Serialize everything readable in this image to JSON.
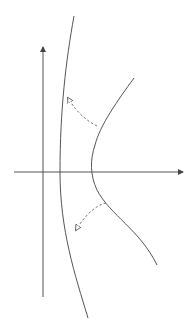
{
  "diagram": {
    "type": "phase-plane-sketch",
    "background": "#ffffff",
    "stroke_color": "#555555",
    "axes": {
      "x_axis": {
        "y": 172,
        "x_start": 14,
        "x_end": 183,
        "arrow": "right"
      },
      "y_axis": {
        "x": 43,
        "y_start": 297,
        "y_end": 47,
        "arrow": "up"
      }
    },
    "curves": [
      {
        "name": "left-curve",
        "style": "solid",
        "path": "M74,16 C66,60 60,110 60,172 C60,230 75,275 88,318"
      },
      {
        "name": "right-curve",
        "style": "solid",
        "path": "M134,78 C118,100 100,125 95,145 C90,160 90,175 97,190 C110,215 140,230 157,265"
      }
    ],
    "arrows": [
      {
        "name": "dashed-arrow-upper",
        "style": "dashed",
        "path": "M97,126 C85,120 75,110 68,98",
        "head": [
          66,
          96
        ]
      },
      {
        "name": "dashed-arrow-lower",
        "style": "dashed",
        "path": "M106,203 C95,205 83,218 76,230",
        "head": [
          75,
          232
        ]
      }
    ]
  }
}
